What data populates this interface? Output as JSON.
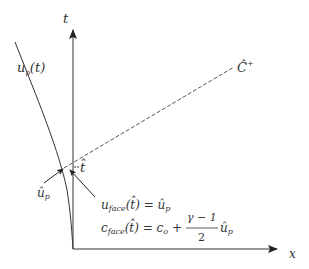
{
  "diagram": {
    "axes": {
      "vertical_label": "t",
      "horizontal_label": "x"
    },
    "curve_label": {
      "base": "u",
      "subscript": "p",
      "arg": "(t)"
    },
    "characteristic_label": {
      "base": "Ĉ",
      "superscript": "+"
    },
    "intersection_time_label": "t̂",
    "piston_velocity_label": {
      "base": "û",
      "subscript": "p"
    },
    "equations": [
      {
        "lhs_base": "u",
        "lhs_sub": "face",
        "lhs_arg": "(t̂) = ",
        "rhs": "û",
        "rhs_sub": "p"
      },
      {
        "lhs_base": "c",
        "lhs_sub": "face",
        "lhs_arg": "(t̂) = ",
        "rhs_c": "c",
        "rhs_c_sub": "o",
        "plus": " + ",
        "frac_num": "γ − 1",
        "frac_den": "2",
        "rhs_u": "û",
        "rhs_u_sub": "p"
      }
    ],
    "colors": {
      "line": "#333333",
      "dashed": "#555555"
    }
  }
}
